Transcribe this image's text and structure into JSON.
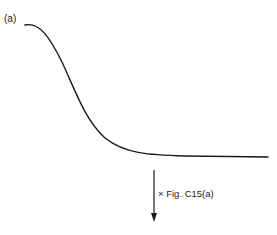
{
  "diagram": {
    "panel_label": "(a)",
    "arrow_label": "× Fig. C15(a)",
    "curve": {
      "description": "sigmoid decreasing curve leveling to a plateau",
      "color": "#1a1a1a"
    },
    "arrow": {
      "direction": "down",
      "color": "#1a1a1a"
    }
  }
}
